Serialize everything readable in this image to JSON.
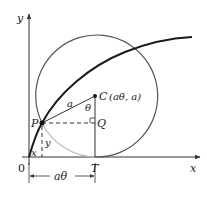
{
  "diagram": {
    "axes": {
      "x_label": "x",
      "y_label": "y",
      "origin_label": "0"
    },
    "points": {
      "P": {
        "label": "P"
      },
      "C": {
        "label": "C",
        "coords": "(aθ, a)"
      },
      "Q": {
        "label": "Q"
      },
      "T": {
        "label": "T"
      }
    },
    "segments": {
      "radius_label": "a",
      "angle_label": "θ",
      "x_label": "x",
      "y_label": "y",
      "distance_label": "aθ"
    },
    "colors": {
      "curve": "#1a1a1a",
      "circle": "#555555",
      "circle_lower_arc": "#bbbbbb",
      "axis": "#333333"
    }
  }
}
